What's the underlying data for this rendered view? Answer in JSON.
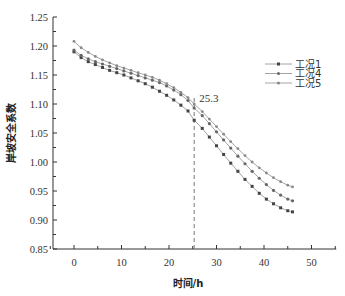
{
  "chart_data": {
    "type": "line",
    "title": "",
    "xlabel": "时间/h",
    "ylabel": "岸坡安全系数",
    "xlim": [
      -5,
      55
    ],
    "ylim": [
      0.85,
      1.25
    ],
    "x_ticks": [
      0,
      10,
      20,
      30,
      40,
      50
    ],
    "y_ticks": [
      "0.85",
      "0.90",
      "0.95",
      "1.00",
      "1.05",
      "1.10",
      "1.15",
      "1.20",
      "1.25"
    ],
    "grid": false,
    "legend_position": "right",
    "annotation": {
      "x": 25.3,
      "label": "25.3",
      "style": "dashed-vertical"
    },
    "x": [
      0,
      1.5,
      3,
      4.5,
      6,
      7.5,
      9,
      10.5,
      12,
      13.5,
      15,
      16.5,
      18,
      19.5,
      21,
      22.5,
      24,
      25.3,
      27,
      28.5,
      30,
      31.5,
      33,
      34.5,
      36,
      37.5,
      39,
      40.5,
      42,
      43.5,
      45,
      46
    ],
    "series": [
      {
        "name": "工况1",
        "marker": "square",
        "color": "#444444",
        "values": [
          1.19,
          1.18,
          1.173,
          1.168,
          1.163,
          1.158,
          1.154,
          1.15,
          1.145,
          1.14,
          1.135,
          1.129,
          1.122,
          1.115,
          1.107,
          1.098,
          1.088,
          1.072,
          1.058,
          1.043,
          1.028,
          1.013,
          0.998,
          0.984,
          0.97,
          0.958,
          0.946,
          0.936,
          0.928,
          0.921,
          0.916,
          0.914
        ]
      },
      {
        "name": "工况4",
        "marker": "diamond",
        "color": "#666666",
        "values": [
          1.193,
          1.184,
          1.178,
          1.173,
          1.169,
          1.165,
          1.161,
          1.157,
          1.153,
          1.149,
          1.145,
          1.141,
          1.137,
          1.131,
          1.124,
          1.116,
          1.106,
          1.093,
          1.08,
          1.066,
          1.052,
          1.038,
          1.024,
          1.01,
          0.997,
          0.984,
          0.972,
          0.961,
          0.951,
          0.943,
          0.936,
          0.933
        ]
      },
      {
        "name": "工况5",
        "marker": "triangle",
        "color": "#888888",
        "values": [
          1.208,
          1.197,
          1.189,
          1.182,
          1.176,
          1.171,
          1.166,
          1.162,
          1.158,
          1.154,
          1.15,
          1.146,
          1.141,
          1.135,
          1.128,
          1.12,
          1.111,
          1.1,
          1.087,
          1.074,
          1.061,
          1.048,
          1.035,
          1.023,
          1.011,
          1.0,
          0.99,
          0.981,
          0.973,
          0.966,
          0.96,
          0.957
        ]
      }
    ]
  }
}
